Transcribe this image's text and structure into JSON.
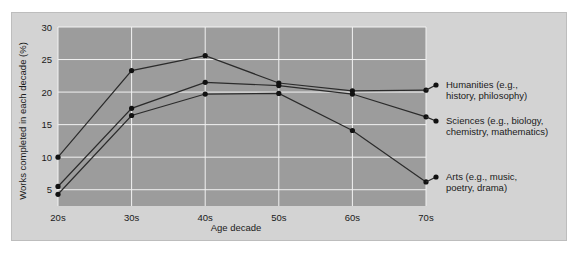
{
  "chart_data": {
    "type": "line",
    "title": "",
    "xlabel": "Age decade",
    "ylabel": "Works completed in each decade (%)",
    "categories": [
      "20s",
      "30s",
      "40s",
      "50s",
      "60s",
      "70s"
    ],
    "xtick_labels": [
      "20s",
      "30s",
      "40s",
      "50s",
      "60s",
      "70s"
    ],
    "ytick_labels": [
      "5",
      "10",
      "15",
      "20",
      "25",
      "30"
    ],
    "ytick_values": [
      5,
      10,
      15,
      20,
      25,
      30
    ],
    "ylim": [
      2.5,
      30
    ],
    "grid": true,
    "legend_position": "right-outside",
    "series": [
      {
        "name": "Humanities (e.g., history, philosophy)",
        "legend_line1": "Humanities (e.g.,",
        "legend_line2": "history, philosophy)",
        "values": [
          10.0,
          23.3,
          25.6,
          21.4,
          20.2,
          20.3
        ]
      },
      {
        "name": "Sciences (e.g., biology, chemistry, mathematics)",
        "legend_line1": "Sciences (e.g., biology,",
        "legend_line2": "chemistry, mathematics)",
        "values": [
          5.5,
          17.5,
          21.5,
          21.0,
          19.7,
          16.2
        ]
      },
      {
        "name": "Arts (e.g., music, poetry, drama)",
        "legend_line1": "Arts (e.g., music,",
        "legend_line2": "poetry, drama)",
        "values": [
          4.3,
          16.4,
          19.7,
          19.8,
          14.1,
          6.2
        ]
      }
    ],
    "colors": {
      "plot_background": "#9c9c9c",
      "figure_background": "#d3d3d3",
      "gridline": "#f2f2f2",
      "line": "#2b2b2b",
      "marker": "#111111",
      "text": "#1a1a1a"
    }
  }
}
